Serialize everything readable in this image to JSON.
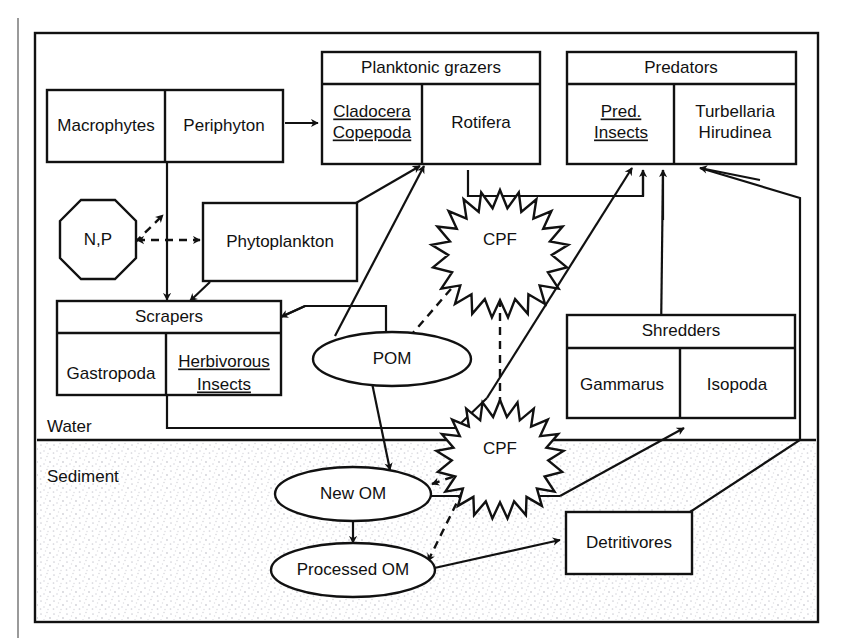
{
  "diagram": {
    "zones": [
      {
        "id": "water",
        "label": "Water"
      },
      {
        "id": "sediment",
        "label": "Sediment"
      }
    ],
    "groups": [
      {
        "id": "planktonic-grazers",
        "header": "Planktonic grazers",
        "cells": [
          {
            "id": "cladocera-copepoda",
            "lines": [
              "Cladocera",
              "Copepoda"
            ],
            "underlined": true
          },
          {
            "id": "rotifera",
            "lines": [
              "Rotifera"
            ],
            "underlined": false
          }
        ]
      },
      {
        "id": "predators",
        "header": "Predators",
        "cells": [
          {
            "id": "pred-insects",
            "lines": [
              "Pred.",
              "Insects"
            ],
            "underlined": true
          },
          {
            "id": "turbellaria-hirudinea",
            "lines": [
              "Turbellaria",
              "Hirudinea"
            ],
            "underlined": false
          }
        ]
      },
      {
        "id": "scrapers",
        "header": "Scrapers",
        "cells": [
          {
            "id": "gastropoda",
            "lines": [
              "Gastropoda"
            ],
            "underlined": false
          },
          {
            "id": "herbivorous-insects",
            "lines": [
              "Herbivorous",
              "Insects"
            ],
            "underlined": true
          }
        ]
      },
      {
        "id": "shredders",
        "header": "Shredders",
        "cells": [
          {
            "id": "gammarus",
            "lines": [
              "Gammarus"
            ],
            "underlined": false
          },
          {
            "id": "isopoda",
            "lines": [
              "Isopoda"
            ],
            "underlined": false
          }
        ]
      }
    ],
    "boxes": [
      {
        "id": "macrophytes",
        "label": "Macrophytes"
      },
      {
        "id": "periphyton",
        "label": "Periphyton"
      },
      {
        "id": "phytoplankton",
        "label": "Phytoplankton"
      },
      {
        "id": "detritivores",
        "label": "Detritivores"
      }
    ],
    "nodes": [
      {
        "id": "np",
        "label": "N,P",
        "shape": "octagon"
      },
      {
        "id": "pom",
        "label": "POM",
        "shape": "ellipse"
      },
      {
        "id": "new-om",
        "label": "New OM",
        "shape": "ellipse"
      },
      {
        "id": "processed-om",
        "label": "Processed OM",
        "shape": "ellipse"
      },
      {
        "id": "cpf-water",
        "label": "CPF",
        "shape": "starburst"
      },
      {
        "id": "cpf-sediment",
        "label": "CPF",
        "shape": "starburst"
      }
    ],
    "colors": {
      "line": "#111111",
      "fill": "#ffffff",
      "sediment": "#f2f2f2",
      "page_edge": "#9a9a9a"
    }
  }
}
